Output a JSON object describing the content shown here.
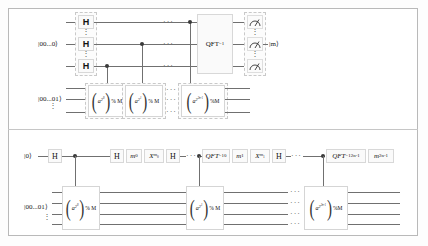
{
  "figure": {
    "frame_color": "#b9b9b9",
    "wire_color": "#707070",
    "gate_fill": "#fafafa"
  },
  "top_circuit": {
    "name": "standard-shor-circuit",
    "registers": [
      {
        "id": "counting",
        "ket": "|00...0⟩",
        "qubits": 3
      },
      {
        "id": "work",
        "ket": "|00...01⟩",
        "qubits": 3
      }
    ],
    "hadamards": [
      "H",
      "H",
      "H"
    ],
    "mod_gates": [
      {
        "base": "a",
        "exp": "2",
        "expexp": "0",
        "mod": "% M"
      },
      {
        "base": "a",
        "exp": "2",
        "expexp": "1",
        "mod": "% M"
      },
      {
        "base": "a",
        "exp": "2",
        "expexp": "2n-1",
        "mod": "%M"
      }
    ],
    "ellipsis": "· · ·",
    "qft_label": "QFT",
    "qft_sup": "−1",
    "measure_icon": "measurement-meter-icon",
    "output_ket": "|m⟩",
    "measurements": 3
  },
  "bottom_circuit": {
    "name": "semiclassical-shor-circuit",
    "control_register": {
      "id": "single-control",
      "ket": "|0⟩"
    },
    "work_register": {
      "id": "work",
      "ket": "|00...01⟩",
      "qubits": 4
    },
    "sequence": [
      {
        "type": "gate",
        "label": "H"
      },
      {
        "type": "control"
      },
      {
        "type": "gate",
        "label": "H"
      },
      {
        "type": "gate",
        "label": "m",
        "sub": "0"
      },
      {
        "type": "gate",
        "label": "X",
        "sup": "m0"
      },
      {
        "type": "gate",
        "label": "H"
      },
      {
        "type": "ellipsis"
      },
      {
        "type": "control"
      },
      {
        "type": "gate",
        "label": "QFT",
        "sup": "-1",
        "sub": "0"
      },
      {
        "type": "gate",
        "label": "m",
        "sub": "1"
      },
      {
        "type": "gate",
        "label": "X",
        "sup": "m1"
      },
      {
        "type": "gate",
        "label": "H"
      },
      {
        "type": "ellipsis"
      },
      {
        "type": "control"
      },
      {
        "type": "gate",
        "label": "QFT",
        "sup": "-1",
        "sub": "2n-1"
      },
      {
        "type": "gate",
        "label": "m",
        "sub": "2n-1"
      }
    ],
    "gate_labels": {
      "h": "H",
      "m0": "m",
      "m0_sub": "0",
      "x0": "X",
      "x0_sup": "m",
      "x0_supsub": "0",
      "qft": "QFT",
      "qft_sup": "−1",
      "qft0_sub": "0",
      "m1": "m",
      "m1_sub": "1",
      "x1": "X",
      "x1_sup": "m",
      "x1_supsub": "1",
      "qftlast_sub": "2n-1",
      "mlast": "m",
      "mlast_sub": "2n-1"
    },
    "mod_gates": [
      {
        "base": "a",
        "exp": "2",
        "expexp": "0",
        "mod": "% M"
      },
      {
        "base": "a",
        "exp": "2",
        "expexp": "1",
        "mod": "% M"
      },
      {
        "base": "a",
        "exp": "2",
        "expexp": "2n-1",
        "mod": "%M"
      }
    ],
    "ellipsis": "· · ·"
  },
  "glyphs": {
    "vdots": "⋮",
    "hdots": "···"
  }
}
